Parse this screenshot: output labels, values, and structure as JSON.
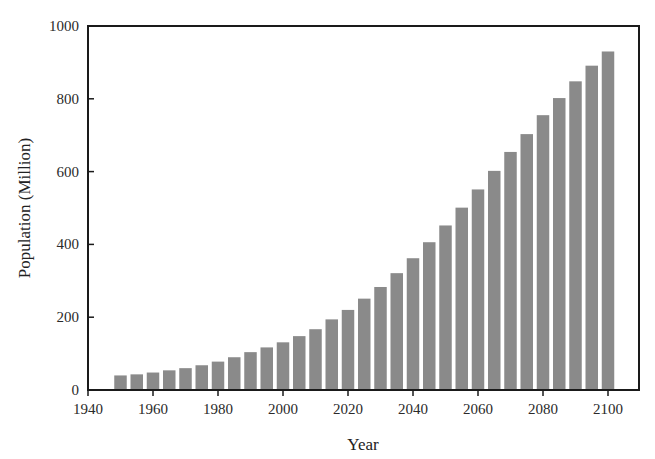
{
  "chart_data": {
    "type": "bar",
    "title": "",
    "xlabel": "Year",
    "ylabel": "Population (Million)",
    "xlim": [
      1940,
      2105
    ],
    "ylim": [
      0,
      1000
    ],
    "x_ticks": [
      1940,
      1960,
      1980,
      2000,
      2020,
      2040,
      2060,
      2080,
      2100
    ],
    "y_ticks": [
      0,
      200,
      400,
      600,
      800,
      1000
    ],
    "grid": false,
    "legend": null,
    "bar_color": "#8a8a8a",
    "categories": [
      1950,
      1955,
      1960,
      1965,
      1970,
      1975,
      1980,
      1985,
      1990,
      1995,
      2000,
      2005,
      2010,
      2015,
      2020,
      2025,
      2030,
      2035,
      2040,
      2045,
      2050,
      2055,
      2060,
      2065,
      2070,
      2075,
      2080,
      2085,
      2090,
      2095,
      2100
    ],
    "values": [
      40,
      43,
      48,
      54,
      60,
      68,
      78,
      90,
      104,
      117,
      131,
      148,
      167,
      194,
      220,
      251,
      283,
      321,
      362,
      406,
      452,
      501,
      551,
      602,
      654,
      703,
      755,
      802,
      848,
      891,
      930
    ]
  },
  "axes": {
    "xlabel": "Year",
    "ylabel": "Population (Million)"
  }
}
